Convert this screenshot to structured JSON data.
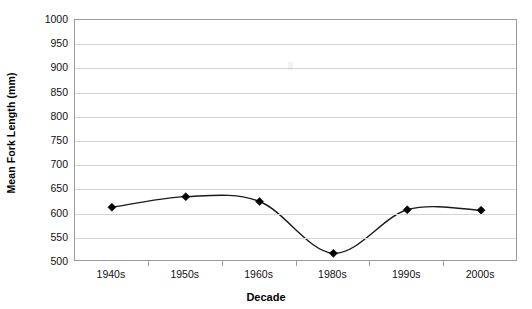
{
  "chart_data": {
    "type": "line",
    "title": "",
    "xlabel": "Decade",
    "ylabel": "Mean Fork Length (mm)",
    "categories": [
      "1940s",
      "1950s",
      "1960s",
      "1980s",
      "1990s",
      "2000s"
    ],
    "values": [
      613,
      635,
      625,
      518,
      608,
      607
    ],
    "series": [
      {
        "name": "Mean Fork Length",
        "values": [
          613,
          635,
          625,
          518,
          608,
          607
        ]
      }
    ],
    "ylim": [
      500,
      1000
    ],
    "ytick_step": 50,
    "yticks": [
      1000,
      950,
      900,
      850,
      800,
      750,
      700,
      650,
      600,
      550,
      500
    ],
    "ytick_labels": [
      "1000",
      "950",
      "900",
      "850",
      "800",
      "750",
      "700",
      "650",
      "600",
      "550",
      "500"
    ],
    "grid": true,
    "grid_axis": "y",
    "legend": false,
    "legend_position": "none",
    "marker": "diamond",
    "line_style": "smoothed",
    "line_color": "#1a1a1a",
    "marker_color": "#000000",
    "grid_color": "#d4d4d4",
    "plot_border_color": "#9a9a9a",
    "background_color": "#ffffff"
  }
}
